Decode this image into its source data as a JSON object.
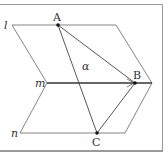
{
  "diagram": {
    "lines": [
      {
        "name": "l",
        "label": "l"
      },
      {
        "name": "m",
        "label": "m"
      },
      {
        "name": "n",
        "label": "n"
      }
    ],
    "points": [
      {
        "name": "A",
        "label": "A"
      },
      {
        "name": "B",
        "label": "B"
      },
      {
        "name": "C",
        "label": "C"
      }
    ],
    "plane_label": "α",
    "colors": {
      "stroke": "#555555",
      "point": "#111111",
      "border": "#9a9a9a"
    }
  }
}
